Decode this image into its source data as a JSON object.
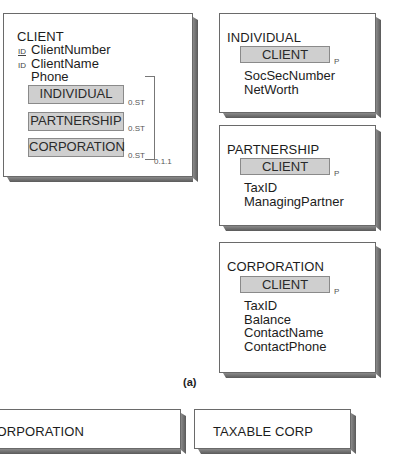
{
  "client_box": {
    "title": "CLIENT",
    "attributes": [
      {
        "marker": "ID",
        "marker_underlined": true,
        "name": "ClientNumber"
      },
      {
        "marker": "ID",
        "marker_underlined": false,
        "name": "ClientName"
      },
      {
        "marker": "",
        "name": "Phone"
      }
    ],
    "subtypes": [
      {
        "name": "INDIVIDUAL",
        "cardinality": "0.ST"
      },
      {
        "name": "PARTNERSHIP",
        "cardinality": "0.ST"
      },
      {
        "name": "CORPORATION",
        "cardinality": "0.ST"
      }
    ],
    "group_cardinality": "0.1.1"
  },
  "individual_box": {
    "title": "INDIVIDUAL",
    "supertype": "CLIENT",
    "supertype_cardinality": "P",
    "attributes": [
      "SocSecNumber",
      "NetWorth"
    ]
  },
  "partnership_box": {
    "title": "PARTNERSHIP",
    "supertype": "CLIENT",
    "supertype_cardinality": "P",
    "attributes": [
      "TaxID",
      "ManagingPartner"
    ]
  },
  "corporation_box": {
    "title": "CORPORATION",
    "supertype": "CLIENT",
    "supertype_cardinality": "P",
    "attributes": [
      "TaxID",
      "Balance",
      "ContactName",
      "ContactPhone"
    ]
  },
  "caption": "(a)",
  "bottom_boxes": [
    {
      "title": "CORPORATION"
    },
    {
      "title": "TAXABLE CORP"
    }
  ]
}
